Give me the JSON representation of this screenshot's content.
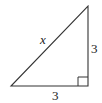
{
  "diagram": {
    "type": "right-triangle",
    "hypotenuse_label": "x",
    "vertical_leg_label": "3",
    "horizontal_leg_label": "3",
    "right_angle_marker": true,
    "stroke_color": "#333333"
  }
}
